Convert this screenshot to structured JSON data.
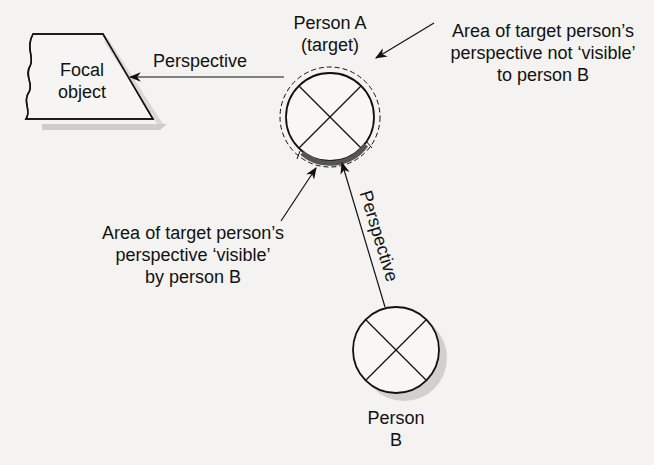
{
  "focal_object": {
    "line1": "Focal",
    "line2": "object"
  },
  "person_a": {
    "line1": "Person A",
    "line2": "(target)"
  },
  "person_b": {
    "line1": "Person",
    "line2": "B"
  },
  "arrow_labels": {
    "left": "Perspective",
    "diagonal": "Perspective"
  },
  "annotation_not_visible": {
    "line1": "Area of target person’s",
    "line2": "perspective not ‘visible’",
    "line3": "to person B"
  },
  "annotation_visible": {
    "line1": "Area of target person’s",
    "line2": "perspective ‘visible’",
    "line3": "by person B"
  },
  "colors": {
    "background": "#f4f3f1",
    "stroke": "#111111",
    "shadow": "#cfcdcb",
    "visible_arc": "#555555"
  }
}
